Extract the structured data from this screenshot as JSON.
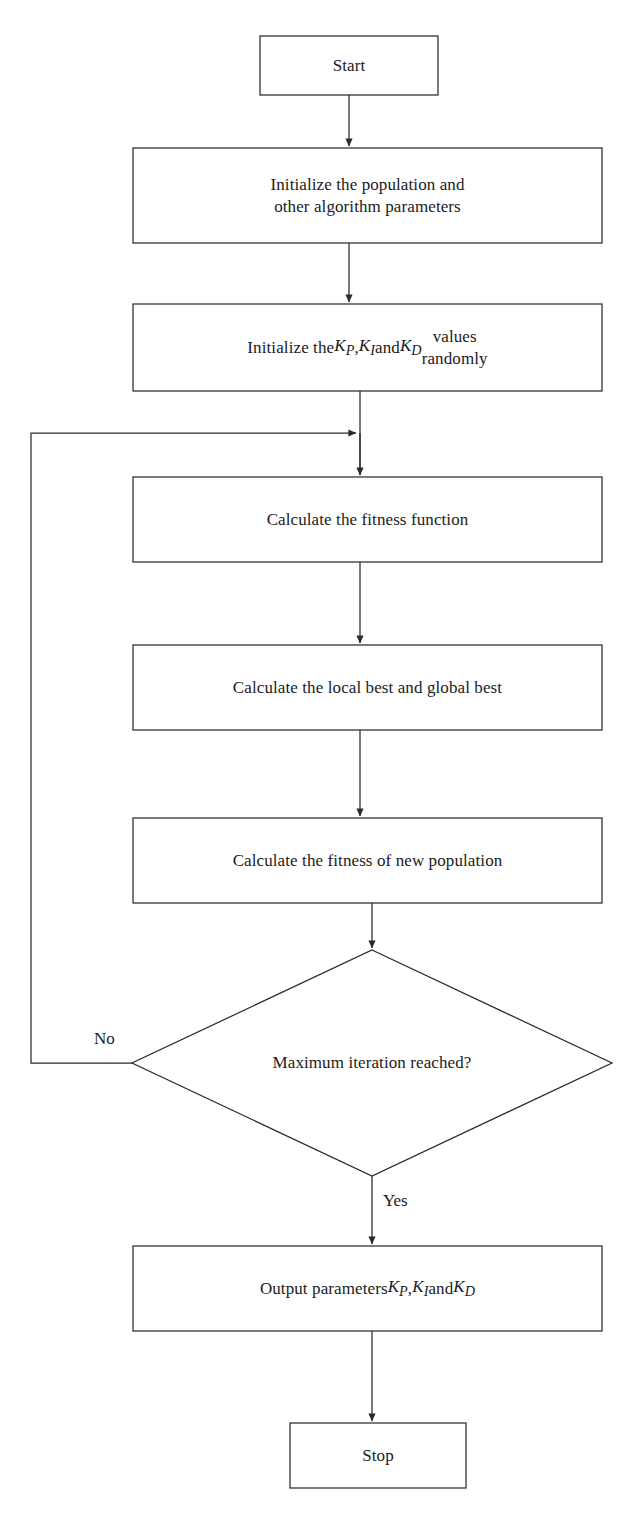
{
  "diagram": {
    "type": "flowchart",
    "background_color": "#ffffff",
    "line_color": "#2b2b2b",
    "text_color": "#1b1b1b",
    "nodes": [
      {
        "id": "start",
        "shape": "rectangle",
        "label": "Start",
        "x": 260,
        "y": 36,
        "w": 178,
        "h": 59
      },
      {
        "id": "init-population",
        "shape": "rectangle",
        "label": "Initialize the population and\nother algorithm parameters",
        "x": 133,
        "y": 148,
        "w": 469,
        "h": 95
      },
      {
        "id": "init-gains",
        "shape": "rectangle",
        "label_html": "Initialize the <i>K<sub>P</sub></i>, <i>K<sub>I</sub></i> and <i>K<sub>D</sub></i> values<br>randomly",
        "label": "Initialize the KP, KI and KD values randomly",
        "x": 133,
        "y": 304,
        "w": 469,
        "h": 87
      },
      {
        "id": "calc-fitness",
        "shape": "rectangle",
        "label": "Calculate the fitness function",
        "x": 133,
        "y": 477,
        "w": 469,
        "h": 85
      },
      {
        "id": "calc-best",
        "shape": "rectangle",
        "label": "Calculate the local best and global best",
        "x": 133,
        "y": 645,
        "w": 469,
        "h": 85
      },
      {
        "id": "calc-new-population",
        "shape": "rectangle",
        "label": "Calculate the fitness of new population",
        "x": 133,
        "y": 818,
        "w": 469,
        "h": 85
      },
      {
        "id": "max-iteration",
        "shape": "diamond",
        "label": "Maximum iteration reached?",
        "cx": 372,
        "cy": 1063,
        "half_w": 240,
        "half_h": 113
      },
      {
        "id": "output-gains",
        "shape": "rectangle",
        "label_html": "Output parameters <i>K<sub>P</sub></i>, <i>K<sub>I</sub></i> and <i>K<sub>D</sub></i>",
        "label": "Output parameters KP, KI and KD",
        "x": 133,
        "y": 1246,
        "w": 469,
        "h": 85
      },
      {
        "id": "stop",
        "shape": "rectangle",
        "label": "Stop",
        "x": 290,
        "y": 1423,
        "w": 176,
        "h": 65
      }
    ],
    "edge_labels": [
      {
        "id": "no-label",
        "text": "No",
        "x": 94,
        "y": 1030
      },
      {
        "id": "yes-label",
        "text": "Yes",
        "x": 383,
        "y": 1192
      }
    ],
    "edges": [
      {
        "from": "start",
        "to": "init-population",
        "arrow": true
      },
      {
        "from": "init-population",
        "to": "init-gains",
        "arrow": true
      },
      {
        "from": "init-gains",
        "to": "calc-fitness",
        "arrow": true
      },
      {
        "from": "calc-fitness",
        "to": "calc-best",
        "arrow": true
      },
      {
        "from": "calc-best",
        "to": "calc-new-population",
        "arrow": true
      },
      {
        "from": "calc-new-population",
        "to": "max-iteration",
        "arrow": true
      },
      {
        "from": "max-iteration",
        "to": "output-gains",
        "arrow": true,
        "label": "Yes"
      },
      {
        "from": "max-iteration",
        "to": "calc-fitness",
        "arrow": true,
        "label": "No",
        "routing": "left-feedback-loop"
      },
      {
        "from": "output-gains",
        "to": "stop",
        "arrow": true
      }
    ]
  }
}
